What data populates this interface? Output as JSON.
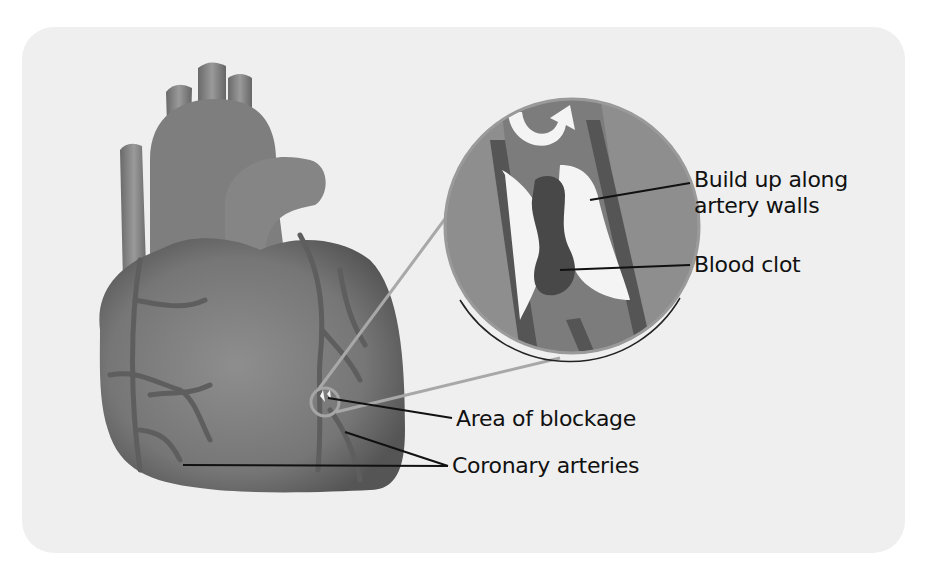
{
  "diagram": {
    "colors": {
      "panel_bg": "#efefef",
      "heart_fill": "#7a7a7a",
      "heart_dark": "#5a5a5a",
      "artery": "#6a6a6a",
      "plaque": "#f4f4f4",
      "clot": "#4a4a4a",
      "lens_bg": "#8c8c8c",
      "leader_line": "#111111"
    },
    "labels": {
      "buildup_line1": "Build up along",
      "buildup_line2": "artery walls",
      "blood_clot": "Blood clot",
      "area_of_blockage": "Area of blockage",
      "coronary_arteries": "Coronary arteries"
    },
    "icons": {
      "flow_arrow": "u-turn-arrow-icon"
    }
  }
}
